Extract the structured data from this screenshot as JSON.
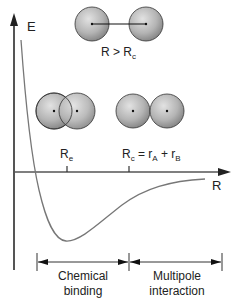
{
  "diagram": {
    "axes": {
      "y_label": "E",
      "x_label": "R"
    },
    "molecules": {
      "separated": {
        "label_main": "R > R",
        "label_sub": "c"
      },
      "equilibrium": {
        "label_main": "R",
        "label_sub": "e"
      },
      "contact": {
        "label_main": "R",
        "label_sub": "c",
        "label_eq": " = r",
        "label_a": "A",
        "label_plus": " + r",
        "label_b": "B"
      }
    },
    "regions": [
      {
        "line1": "Chemical",
        "line2": "binding"
      },
      {
        "line1": "Multipole",
        "line2": "interaction"
      }
    ],
    "colors": {
      "axis": "#555555",
      "curve": "#777777",
      "atom_fill_light": "#d8d8d8",
      "atom_fill_dark": "#8a8a8a",
      "atom_stroke": "#333333"
    }
  }
}
